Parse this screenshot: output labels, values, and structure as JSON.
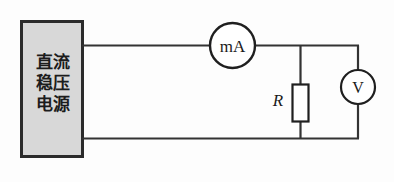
{
  "figure": {
    "kind": "circuit-diagram",
    "background_color": "#fdfdfd",
    "line_color": "#333333"
  },
  "power_supply": {
    "label_lines": "直流\n稳压\n电源",
    "label_text": "直流稳压电源",
    "fill_color": "#d8d8d8",
    "border_color": "#2b2b2b"
  },
  "ammeter": {
    "label": "mA",
    "symbol_name": "milliammeter"
  },
  "voltmeter": {
    "label": "V",
    "symbol_name": "voltmeter"
  },
  "resistor": {
    "label": "R",
    "symbol_name": "resistor"
  },
  "wires": {
    "top_rail_label": "top-wire",
    "bottom_rail_label": "bottom-wire",
    "right_rail_label": "right-wire",
    "resistor_branch_label": "resistor-branch-wire"
  }
}
